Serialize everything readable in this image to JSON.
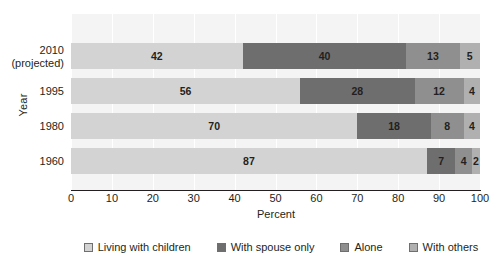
{
  "chart_data": {
    "type": "bar",
    "orientation": "horizontal",
    "stacked": true,
    "title": "",
    "xlabel": "Percent",
    "ylabel": "Year",
    "xlim": [
      0,
      100
    ],
    "xticks": [
      0,
      10,
      20,
      30,
      40,
      50,
      60,
      70,
      80,
      90,
      100
    ],
    "grid": true,
    "legend_position": "bottom",
    "categories": [
      "2010 (projected)",
      "1995",
      "1980",
      "1960"
    ],
    "category_labels": [
      {
        "main": "2010",
        "sub": "(projected)"
      },
      {
        "main": "1995",
        "sub": ""
      },
      {
        "main": "1980",
        "sub": ""
      },
      {
        "main": "1960",
        "sub": ""
      }
    ],
    "series": [
      {
        "name": "Living with children",
        "color": "#d3d3d3",
        "values": [
          42,
          56,
          70,
          87
        ]
      },
      {
        "name": "With spouse only",
        "color": "#6e6e6e",
        "values": [
          40,
          28,
          18,
          7
        ]
      },
      {
        "name": "Alone",
        "color": "#8f8f8f",
        "values": [
          13,
          12,
          8,
          4
        ]
      },
      {
        "name": "With others",
        "color": "#b0b0b0",
        "values": [
          5,
          4,
          4,
          2
        ]
      }
    ]
  },
  "legend": {
    "items": [
      {
        "label": "Living with children",
        "color": "#d3d3d3"
      },
      {
        "label": "With spouse only",
        "color": "#6e6e6e"
      },
      {
        "label": "Alone",
        "color": "#8f8f8f"
      },
      {
        "label": "With others",
        "color": "#b0b0b0"
      }
    ]
  },
  "axes": {
    "x_title": "Percent",
    "y_title": "Year",
    "x_tick_labels": [
      "0",
      "10",
      "20",
      "30",
      "40",
      "50",
      "60",
      "70",
      "80",
      "90",
      "100"
    ]
  },
  "colors": {
    "plot_background": "#f4f4f4",
    "gridline": "#ffffff",
    "axis": "#231f20",
    "text": "#231f20"
  }
}
